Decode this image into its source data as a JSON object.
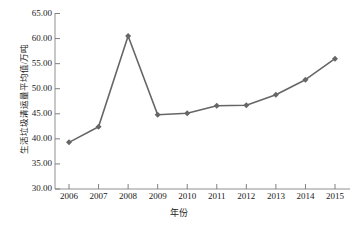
{
  "chart_data": {
    "type": "line",
    "title": "",
    "xlabel": "年份",
    "ylabel": "生活垃圾清运量平均值/万吨",
    "categories": [
      "2006",
      "2007",
      "2008",
      "2009",
      "2010",
      "2011",
      "2012",
      "2013",
      "2014",
      "2015"
    ],
    "x": [
      2006,
      2007,
      2008,
      2009,
      2010,
      2011,
      2012,
      2013,
      2014,
      2015
    ],
    "values": [
      39.3,
      42.4,
      60.5,
      44.8,
      45.1,
      46.6,
      46.7,
      48.8,
      51.8,
      56.0
    ],
    "series": [
      {
        "name": "生活垃圾清运量平均值",
        "values": [
          39.3,
          42.4,
          60.5,
          44.8,
          45.1,
          46.6,
          46.7,
          48.8,
          51.8,
          56.0
        ]
      }
    ],
    "ylim": [
      30.0,
      65.0
    ],
    "yticks": [
      30.0,
      35.0,
      40.0,
      45.0,
      50.0,
      55.0,
      60.0,
      65.0
    ],
    "ytick_labels": [
      "30.00",
      "35.00",
      "40.00",
      "45.00",
      "50.00",
      "55.00",
      "60.00",
      "65.00"
    ],
    "grid": false,
    "legend": false,
    "legend_position": "none",
    "line_color": "#666666",
    "marker_color": "#666666",
    "marker": "diamond",
    "axis_color": "#808080"
  },
  "figure": {
    "background_color": "#ffffff",
    "text_color": "#1a1a1a"
  }
}
